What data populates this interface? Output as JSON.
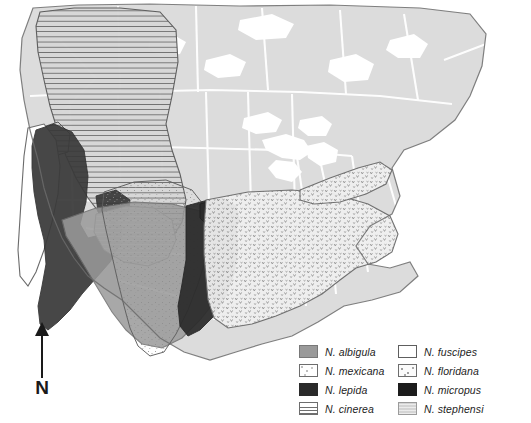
{
  "figure": {
    "background_color": "#ffffff",
    "land_color": "#dcdcdc",
    "border_color": "#ffffff",
    "coast_outline_color": "#6b6b6b"
  },
  "north_arrow": {
    "label": "N",
    "icon": "north-arrow-icon",
    "direction": "up"
  },
  "legend": {
    "columns": [
      {
        "items": [
          {
            "label": "N. albigula",
            "swatch": "sw-albigula",
            "pattern": "solid-medium-gray",
            "color": "#9a9a9a"
          },
          {
            "label": "N. mexicana",
            "swatch": "sw-mexicana",
            "pattern": "fine-stipple",
            "color": "#ffffff"
          },
          {
            "label": "N. lepida",
            "swatch": "sw-lepida",
            "pattern": "solid-near-black",
            "color": "#2a2a2a"
          },
          {
            "label": "N. cinerea",
            "swatch": "sw-cinerea",
            "pattern": "horizontal-lines",
            "color": "#6f6f6f"
          }
        ]
      },
      {
        "items": [
          {
            "label": "N. fuscipes",
            "swatch": "sw-fuscipes",
            "pattern": "white-outline",
            "color": "#ffffff"
          },
          {
            "label": "N. floridana",
            "swatch": "sw-floridana",
            "pattern": "v-speckle",
            "color": "#9f9f9f"
          },
          {
            "label": "N. micropus",
            "swatch": "sw-micropus",
            "pattern": "solid-black",
            "color": "#1c1c1c"
          },
          {
            "label": "N. stephensi",
            "swatch": "sw-stephensi",
            "pattern": "light-gray-texture",
            "color": "#d4d4d4"
          }
        ]
      }
    ]
  },
  "map_regions": [
    {
      "species": "N. cinerea",
      "area": "Pacific Northwest / northern Rocky Mountains",
      "pattern": "horizontal-lines"
    },
    {
      "species": "N. lepida",
      "area": "California and Great Basin / Nevada",
      "pattern": "solid-near-black"
    },
    {
      "species": "N. fuscipes",
      "area": "Pacific coast of California",
      "pattern": "white-outline"
    },
    {
      "species": "N. albigula",
      "area": "Southwest deserts / northern Mexico",
      "pattern": "solid-medium-gray"
    },
    {
      "species": "N. mexicana",
      "area": "Southern Rocky Mountains / Mexican highlands",
      "pattern": "fine-stipple"
    },
    {
      "species": "N. stephensi",
      "area": "Colorado Plateau, Arizona and New Mexico",
      "pattern": "light-gray-texture"
    },
    {
      "species": "N. micropus",
      "area": "Southern Great Plains and Texas",
      "pattern": "solid-black"
    },
    {
      "species": "N. floridana",
      "area": "Eastern United States and Appalachians",
      "pattern": "v-speckle"
    }
  ]
}
